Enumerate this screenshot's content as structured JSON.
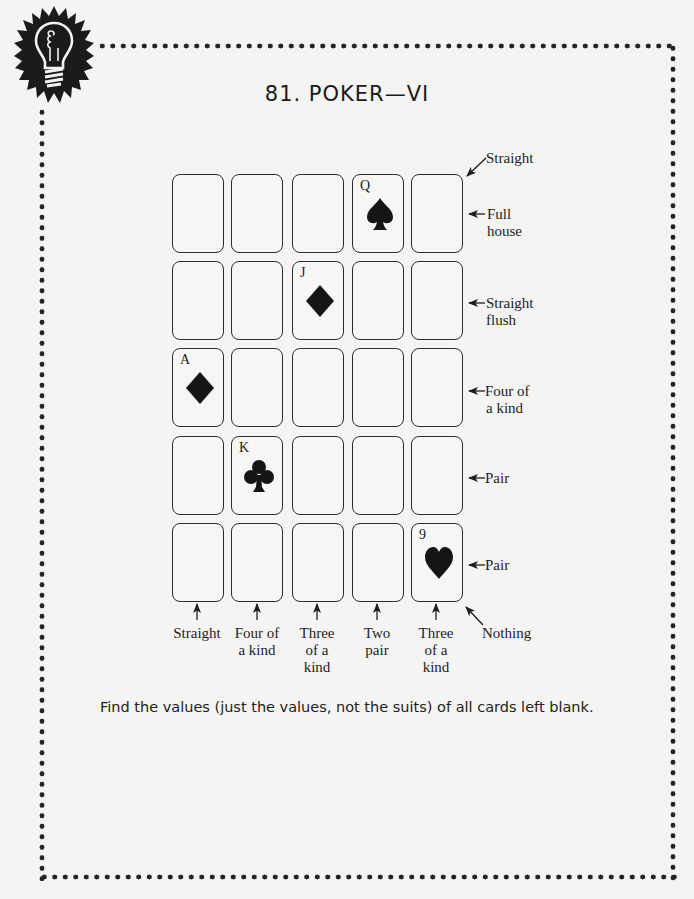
{
  "header": {
    "badge_icon": "lightbulb-icon",
    "title": "81. POKER—VI"
  },
  "grid": {
    "rows": [
      [
        {
          "rank": "",
          "suit": ""
        },
        {
          "rank": "",
          "suit": ""
        },
        {
          "rank": "",
          "suit": ""
        },
        {
          "rank": "Q",
          "suit": "spade"
        },
        {
          "rank": "",
          "suit": ""
        }
      ],
      [
        {
          "rank": "",
          "suit": ""
        },
        {
          "rank": "",
          "suit": ""
        },
        {
          "rank": "J",
          "suit": "diamond"
        },
        {
          "rank": "",
          "suit": ""
        },
        {
          "rank": "",
          "suit": ""
        }
      ],
      [
        {
          "rank": "A",
          "suit": "diamond"
        },
        {
          "rank": "",
          "suit": ""
        },
        {
          "rank": "",
          "suit": ""
        },
        {
          "rank": "",
          "suit": ""
        },
        {
          "rank": "",
          "suit": ""
        }
      ],
      [
        {
          "rank": "",
          "suit": ""
        },
        {
          "rank": "K",
          "suit": "club"
        },
        {
          "rank": "",
          "suit": ""
        },
        {
          "rank": "",
          "suit": ""
        },
        {
          "rank": "",
          "suit": ""
        }
      ],
      [
        {
          "rank": "",
          "suit": ""
        },
        {
          "rank": "",
          "suit": ""
        },
        {
          "rank": "",
          "suit": ""
        },
        {
          "rank": "",
          "suit": ""
        },
        {
          "rank": "9",
          "suit": "heart"
        }
      ]
    ]
  },
  "diagonal_labels": {
    "top_right": "Straight",
    "bottom_right": "Nothing"
  },
  "row_labels": [
    {
      "line1": "Full",
      "line2": "house"
    },
    {
      "line1": "Straight",
      "line2": "flush"
    },
    {
      "line1": "Four of",
      "line2": "a kind"
    },
    {
      "line1": "Pair",
      "line2": ""
    },
    {
      "line1": "Pair",
      "line2": ""
    }
  ],
  "column_labels": [
    {
      "line1": "Straight",
      "line2": "",
      "line3": ""
    },
    {
      "line1": "Four of",
      "line2": "a kind",
      "line3": ""
    },
    {
      "line1": "Three",
      "line2": "of a",
      "line3": "kind"
    },
    {
      "line1": "Two",
      "line2": "pair",
      "line3": ""
    },
    {
      "line1": "Three",
      "line2": "of a",
      "line3": "kind"
    }
  ],
  "instruction": "Find the values (just the values, not the suits) of all cards left blank.",
  "colors": {
    "ink": "#1e1e1e",
    "paper": "#f4f4f3"
  }
}
